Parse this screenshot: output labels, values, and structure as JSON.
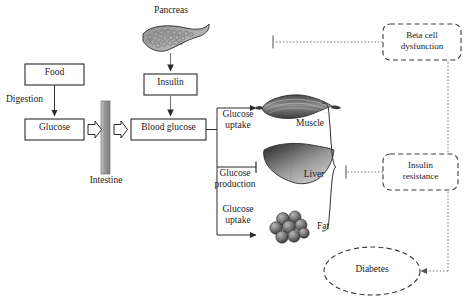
{
  "diagram": {
    "type": "flow-diagram",
    "colors": {
      "stroke": "#2b2b2b",
      "dashed_stroke": "#555555",
      "dotted_stroke": "#777777",
      "intestine_fill_light": "#d8d8d8",
      "intestine_fill_dark": "#8e8e8e",
      "organ_dark": "#3a3a3a",
      "organ_light": "#c9c9c9",
      "background": "#ffffff"
    },
    "nodes": {
      "food": {
        "label": "Food",
        "shape": "rectangle"
      },
      "glucose": {
        "label": "Glucose",
        "shape": "rectangle"
      },
      "pancreas": {
        "label": "Pancreas",
        "shape": "organ-illustration"
      },
      "insulin": {
        "label": "Insulin",
        "shape": "rectangle"
      },
      "blood_glucose": {
        "label": "Blood glucose",
        "shape": "rectangle"
      },
      "intestine": {
        "label": "Intestine",
        "shape": "vertical-bar"
      },
      "muscle": {
        "label": "Muscle",
        "shape": "organ-illustration"
      },
      "liver": {
        "label": "Liver",
        "shape": "organ-illustration"
      },
      "fat": {
        "label": "Fat",
        "shape": "organ-illustration"
      },
      "beta_cell_dysfunction": {
        "label_line1": "Beta cell",
        "label_line2": "dysfunction",
        "shape": "dashed-rounded-rectangle"
      },
      "insulin_resistance": {
        "label_line1": "Insulin",
        "label_line2": "resistance",
        "shape": "dashed-rounded-rectangle"
      },
      "diabetes": {
        "label": "Diabetes",
        "shape": "dashed-ellipse"
      }
    },
    "edge_labels": {
      "digestion": "Digestion",
      "glucose_uptake_muscle_line1": "Glucose",
      "glucose_uptake_muscle_line2": "uptake",
      "glucose_production_line1": "Glucose",
      "glucose_production_line2": "production",
      "glucose_uptake_fat_line1": "Glucose",
      "glucose_uptake_fat_line2": "uptake"
    },
    "edges": [
      {
        "from": "food",
        "to": "glucose",
        "label": "Digestion",
        "marker": "arrow"
      },
      {
        "from": "glucose",
        "to": "intestine",
        "marker": "block-arrow"
      },
      {
        "from": "intestine",
        "to": "blood_glucose",
        "marker": "block-arrow"
      },
      {
        "from": "pancreas",
        "to": "insulin",
        "marker": "arrow"
      },
      {
        "from": "insulin",
        "to": "blood_glucose",
        "marker": "arrow"
      },
      {
        "from": "blood_glucose",
        "to": "muscle",
        "label": "Glucose uptake",
        "marker": "arrow"
      },
      {
        "from": "blood_glucose",
        "to": "liver",
        "label": "Glucose production",
        "marker": "inhibition-bar"
      },
      {
        "from": "blood_glucose",
        "to": "fat",
        "label": "Glucose uptake",
        "marker": "arrow"
      },
      {
        "from": "beta_cell_dysfunction",
        "to": "insulin_secretion",
        "marker": "inhibition-bar",
        "style": "dotted"
      },
      {
        "from": "insulin_resistance",
        "to": "tissue-group",
        "marker": "inhibition-bar",
        "style": "dotted"
      },
      {
        "from": "beta_cell_dysfunction",
        "to": "diabetes",
        "marker": "arrow",
        "style": "dotted"
      },
      {
        "from": "insulin_resistance",
        "to": "diabetes",
        "marker": "arrow",
        "style": "dotted"
      }
    ]
  }
}
